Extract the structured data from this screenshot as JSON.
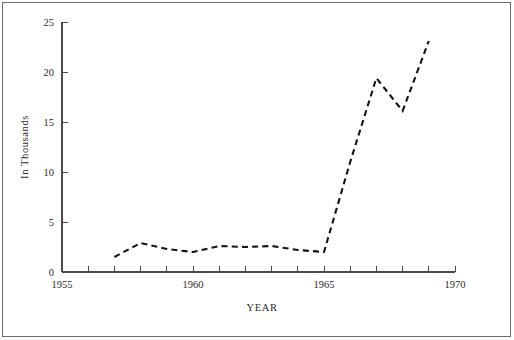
{
  "chart_data": {
    "type": "line",
    "title": "",
    "subtitle": "",
    "xlabel": "YEAR",
    "ylabel": "In Thousands",
    "xlim": [
      1955,
      1970
    ],
    "ylim": [
      0,
      25
    ],
    "grid": false,
    "legend": null,
    "line_style": "dashed",
    "line_color": "#141414",
    "x_tick_labels": [
      "1955",
      "1960",
      "1965",
      "1970"
    ],
    "x_labeled_ticks": [
      1955,
      1960,
      1965,
      1970
    ],
    "x_all_ticks": [
      1955,
      1956,
      1957,
      1958,
      1959,
      1960,
      1961,
      1962,
      1963,
      1964,
      1965,
      1966,
      1967,
      1968,
      1969,
      1970
    ],
    "y_tick_labels": [
      "0",
      "5",
      "10",
      "15",
      "20",
      "25"
    ],
    "y_ticks": [
      0,
      5,
      10,
      15,
      20,
      25
    ],
    "x": [
      1957,
      1958,
      1959,
      1960,
      1961,
      1962,
      1963,
      1964,
      1965,
      1966,
      1967,
      1968,
      1969
    ],
    "values": [
      1.5,
      2.9,
      2.3,
      2.0,
      2.6,
      2.5,
      2.6,
      2.2,
      2.0,
      11.0,
      19.4,
      16.1,
      23.1
    ],
    "series": [
      {
        "name": "",
        "x": [
          1957,
          1958,
          1959,
          1960,
          1961,
          1962,
          1963,
          1964,
          1965,
          1966,
          1967,
          1968,
          1969
        ],
        "values": [
          1.5,
          2.9,
          2.3,
          2.0,
          2.6,
          2.5,
          2.6,
          2.2,
          2.0,
          11.0,
          19.4,
          16.1,
          23.1
        ]
      }
    ],
    "annotations": []
  },
  "figure": {
    "background_color": "#ffffff",
    "border_color": "#6b6b6b",
    "axis_color": "#4a4a4a",
    "text_color": "#2b2b2b"
  }
}
